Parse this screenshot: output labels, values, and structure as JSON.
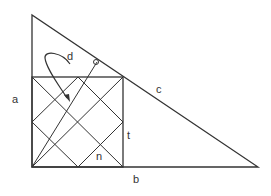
{
  "diagram": {
    "labels": {
      "a": "a",
      "b": "b",
      "c": "c",
      "d": "d",
      "t": "t",
      "n": "n"
    },
    "colors": {
      "stroke": "#333333",
      "background": "#ffffff"
    }
  }
}
